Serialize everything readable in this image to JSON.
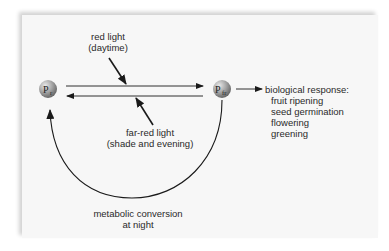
{
  "diagram": {
    "nodes": [
      {
        "id": "pr",
        "label": "P",
        "subscript": "r",
        "x": 48,
        "y": 89
      },
      {
        "id": "pfr",
        "label": "P",
        "subscript": "fr",
        "x": 222,
        "y": 89
      }
    ],
    "labels": {
      "red_light_line1": "red light",
      "red_light_line2": "(daytime)",
      "far_red_line1": "far-red light",
      "far_red_line2": "(shade and evening)",
      "metabolic_line1": "metabolic conversion",
      "metabolic_line2": "at night",
      "response_title": "biological response:",
      "responses": [
        "fruit ripening",
        "seed germination",
        "flowering",
        "greening"
      ]
    },
    "edges": [
      {
        "from": "pr",
        "to": "pfr",
        "label": "red light (daytime)"
      },
      {
        "from": "pfr",
        "to": "pr",
        "label": "far-red light (shade and evening)"
      },
      {
        "from": "pfr",
        "to": "pr",
        "label": "metabolic conversion at night"
      },
      {
        "from": "pfr",
        "to": "biological response",
        "label": ""
      }
    ],
    "colors": {
      "panel_bg": "#f7f7f7",
      "line": "#1a1a1a",
      "node_fill": "#9a9a9a"
    }
  }
}
